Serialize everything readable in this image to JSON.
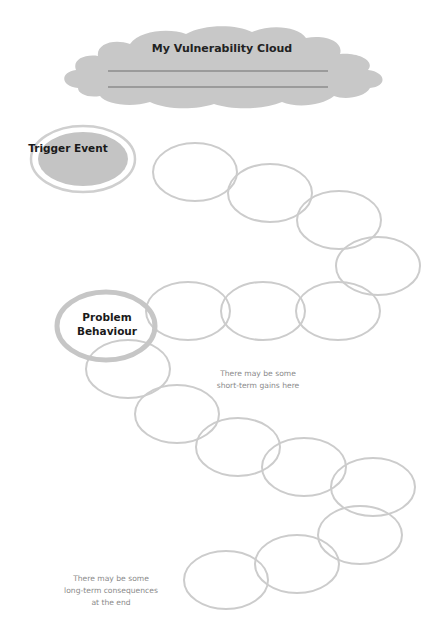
{
  "cloud": {
    "title": "My Vulnerability Cloud",
    "blank_lines": 2,
    "color": "#c8c8c8"
  },
  "trigger": {
    "label": "Trigger Event",
    "fill": "#c4c4c4",
    "ring": "#cfcfcf"
  },
  "problem": {
    "label_line1": "Problem",
    "label_line2": "Behaviour",
    "ring": "#c6c6c6"
  },
  "chain_ring_color": "#cccccc",
  "chain_before_count": 7,
  "chain_after_count": 8,
  "notes": {
    "short_term": [
      "There may be some",
      "short-term gains here"
    ],
    "long_term": [
      "There may be some",
      "long-term consequences",
      "at the end"
    ]
  }
}
